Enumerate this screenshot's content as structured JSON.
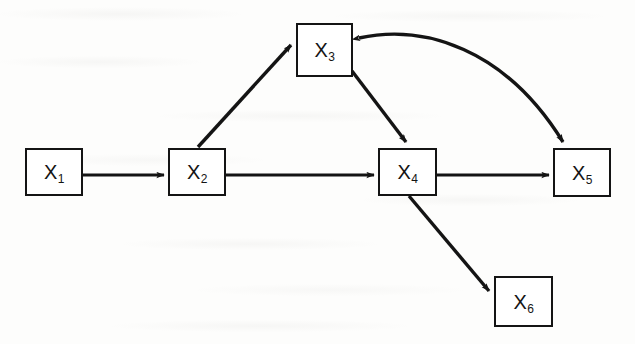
{
  "figure": {
    "kind": "directed-graph",
    "caption": "",
    "width": 635,
    "height": 344,
    "background_color": "#fdfdfc",
    "stroke_color": "#141414",
    "node_fill_color": "#ffffff"
  },
  "nodes": [
    {
      "id": "X1",
      "label_base": "X",
      "label_sub": "1",
      "x": 25,
      "y": 148,
      "w": 58,
      "h": 48
    },
    {
      "id": "X2",
      "label_base": "X",
      "label_sub": "2",
      "x": 168,
      "y": 148,
      "w": 58,
      "h": 48
    },
    {
      "id": "X3",
      "label_base": "X",
      "label_sub": "3",
      "x": 296,
      "y": 23,
      "w": 57,
      "h": 54
    },
    {
      "id": "X4",
      "label_base": "X",
      "label_sub": "4",
      "x": 378,
      "y": 148,
      "w": 59,
      "h": 48
    },
    {
      "id": "X5",
      "label_base": "X",
      "label_sub": "5",
      "x": 553,
      "y": 148,
      "w": 58,
      "h": 49
    },
    {
      "id": "X6",
      "label_base": "X",
      "label_sub": "6",
      "x": 494,
      "y": 276,
      "w": 59,
      "h": 51
    }
  ],
  "edges": [
    {
      "id": "e1",
      "from": "X1",
      "to": "X2",
      "shape": "straight",
      "arrowhead": "end",
      "path": "M 83,175 L 164,175"
    },
    {
      "id": "e2",
      "from": "X2",
      "to": "X3",
      "shape": "straight",
      "arrowhead": "end",
      "path": "M 198,147 L 291,45"
    },
    {
      "id": "e3",
      "from": "X2",
      "to": "X4",
      "shape": "straight",
      "arrowhead": "end",
      "path": "M 226,175 L 374,175"
    },
    {
      "id": "e4",
      "from": "X3",
      "to": "X4",
      "shape": "straight",
      "arrowhead": "end",
      "path": "M 352,71 L 407,143"
    },
    {
      "id": "e5",
      "from": "X4",
      "to": "X5",
      "shape": "straight",
      "arrowhead": "end",
      "path": "M 437,175 L 549,175"
    },
    {
      "id": "e6",
      "from": "X4",
      "to": "X6",
      "shape": "straight",
      "arrowhead": "end",
      "path": "M 409,196 L 490,292"
    },
    {
      "id": "e7",
      "from": "X3",
      "to": "X5",
      "shape": "curved",
      "arrowhead": "both",
      "path": "M 358,38 C 420,25 500,45 563,143",
      "note": "curved feedback link, arrowhead at X3 end and at X5 end"
    }
  ]
}
